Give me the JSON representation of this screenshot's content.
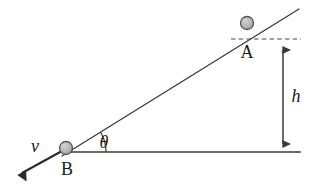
{
  "figure": {
    "type": "physics-diagram",
    "background_color": "#ffffff",
    "line_color": "#3a3a3a",
    "label_color": "#1a1a1a",
    "ball_fill_color": "#b5b5b5",
    "ball_stroke_color": "#555555"
  },
  "labels": {
    "point_a": "A",
    "point_b": "B",
    "height": "h",
    "velocity": "v",
    "angle": "θ"
  },
  "geometry": {
    "ground_line": {
      "x1": 68,
      "y1": 152,
      "x2": 300,
      "y2": 152
    },
    "incline_line": {
      "x1": 63,
      "y1": 155,
      "x2": 299,
      "y2": 9
    },
    "dashed_line": {
      "x1": 231,
      "y1": 39,
      "x2": 301,
      "y2": 39
    },
    "height_arrow": {
      "x": 283,
      "y_top": 41,
      "y_bottom": 152
    },
    "velocity_arrow": {
      "x1": 62,
      "y1": 151,
      "x2": 18,
      "y2": 176
    },
    "angle_arc": {
      "cx": 68,
      "cy": 152,
      "radius": 38,
      "sweep_degrees": 31.7
    },
    "ball_a": {
      "cx": 247,
      "cy": 23,
      "r": 6.5
    },
    "ball_b": {
      "cx": 66,
      "cy": 148,
      "r": 6.5
    },
    "label_a_pos": {
      "x": 247,
      "y": 57
    },
    "label_b_pos": {
      "x": 67,
      "y": 174
    },
    "label_h_pos": {
      "x": 295,
      "y": 101
    },
    "label_v_pos": {
      "x": 35,
      "y": 151
    },
    "label_theta_pos": {
      "x": 103,
      "y": 147
    }
  }
}
